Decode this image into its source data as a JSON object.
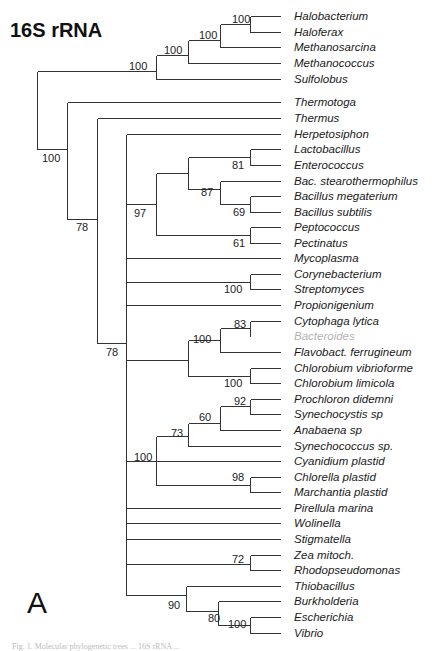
{
  "figure": {
    "title": "16S rRNA",
    "panel_label": "A",
    "caption_partial": "Fig. 1. Molecular phylogenetic trees ... 16S rRNA ..."
  },
  "tree": {
    "tip_line_end_x": 280,
    "tip_label_x": 294,
    "tips": [
      {
        "name": "Halobacterium",
        "y": 16
      },
      {
        "name": "Haloferax",
        "y": 32
      },
      {
        "name": "Methanosarcina",
        "y": 47
      },
      {
        "name": "Methanococcus",
        "y": 63
      },
      {
        "name": "Sulfolobus",
        "y": 79
      },
      {
        "name": "Thermotoga",
        "y": 102
      },
      {
        "name": "Thermus",
        "y": 118
      },
      {
        "name": "Herpetosiphon",
        "y": 134
      },
      {
        "name": "Lactobacillus",
        "y": 149
      },
      {
        "name": "Enterococcus",
        "y": 165
      },
      {
        "name": "Bac. stearothermophilus",
        "y": 181
      },
      {
        "name": "Bacillus megaterium",
        "y": 196
      },
      {
        "name": "Bacillus subtilis",
        "y": 212
      },
      {
        "name": "Peptococcus",
        "y": 227
      },
      {
        "name": "Pectinatus",
        "y": 243
      },
      {
        "name": "Mycoplasma",
        "y": 258
      },
      {
        "name": "Corynebacterium",
        "y": 274
      },
      {
        "name": "Streptomyces",
        "y": 289
      },
      {
        "name": "Propionigenium",
        "y": 305
      },
      {
        "name": "Cytophaga lytica",
        "y": 321
      },
      {
        "name": "Bacteroides",
        "y": 336,
        "faint": true
      },
      {
        "name": "Flavobact. ferrugineum",
        "y": 352
      },
      {
        "name": "Chlorobium vibrioforme",
        "y": 368
      },
      {
        "name": "Chlorobium limicola",
        "y": 383
      },
      {
        "name": "Prochloron didemni",
        "y": 399
      },
      {
        "name": "Synechocystis sp",
        "y": 414
      },
      {
        "name": "Anabaena sp",
        "y": 430
      },
      {
        "name": "Synechococcus sp.",
        "y": 446
      },
      {
        "name": "Cyanidium  plastid",
        "y": 461
      },
      {
        "name": "Chlorella plastid",
        "y": 477
      },
      {
        "name": "Marchantia plastid",
        "y": 492
      },
      {
        "name": "Pirellula marina",
        "y": 508
      },
      {
        "name": "Wolinella",
        "y": 523
      },
      {
        "name": "Stigmatella",
        "y": 539
      },
      {
        "name": "Zea mitoch.",
        "y": 555
      },
      {
        "name": "Rhodopseudomonas",
        "y": 570
      },
      {
        "name": "Thiobacillus",
        "y": 586
      },
      {
        "name": "Burkholderia",
        "y": 601
      },
      {
        "name": "Escherichia",
        "y": 617
      },
      {
        "name": "Vibrio",
        "y": 633
      }
    ],
    "branches": [
      {
        "x1": 250,
        "y1": 16,
        "x2": 280,
        "y2": 16
      },
      {
        "x1": 250,
        "y1": 32,
        "x2": 280,
        "y2": 32
      },
      {
        "x1": 250,
        "y1": 16,
        "x2": 250,
        "y2": 32
      },
      {
        "x1": 220,
        "y1": 24,
        "x2": 250,
        "y2": 24
      },
      {
        "x1": 220,
        "y1": 47,
        "x2": 280,
        "y2": 47
      },
      {
        "x1": 220,
        "y1": 24,
        "x2": 220,
        "y2": 47
      },
      {
        "x1": 188,
        "y1": 40,
        "x2": 220,
        "y2": 40
      },
      {
        "x1": 188,
        "y1": 63,
        "x2": 280,
        "y2": 63
      },
      {
        "x1": 188,
        "y1": 40,
        "x2": 188,
        "y2": 63
      },
      {
        "x1": 156,
        "y1": 55,
        "x2": 188,
        "y2": 55
      },
      {
        "x1": 156,
        "y1": 79,
        "x2": 280,
        "y2": 79
      },
      {
        "x1": 156,
        "y1": 55,
        "x2": 156,
        "y2": 79
      },
      {
        "x1": 37,
        "y1": 71,
        "x2": 156,
        "y2": 71
      },
      {
        "x1": 37,
        "y1": 71,
        "x2": 37,
        "y2": 149
      },
      {
        "x1": 37,
        "y1": 149,
        "x2": 67,
        "y2": 149
      },
      {
        "x1": 67,
        "y1": 102,
        "x2": 280,
        "y2": 102
      },
      {
        "x1": 67,
        "y1": 102,
        "x2": 67,
        "y2": 219
      },
      {
        "x1": 67,
        "y1": 219,
        "x2": 97,
        "y2": 219
      },
      {
        "x1": 97,
        "y1": 118,
        "x2": 280,
        "y2": 118
      },
      {
        "x1": 97,
        "y1": 118,
        "x2": 97,
        "y2": 343
      },
      {
        "x1": 97,
        "y1": 343,
        "x2": 126,
        "y2": 343
      },
      {
        "x1": 126,
        "y1": 134,
        "x2": 126,
        "y2": 595
      },
      {
        "x1": 126,
        "y1": 134,
        "x2": 280,
        "y2": 134
      },
      {
        "x1": 250,
        "y1": 149,
        "x2": 280,
        "y2": 149
      },
      {
        "x1": 250,
        "y1": 165,
        "x2": 280,
        "y2": 165
      },
      {
        "x1": 250,
        "y1": 149,
        "x2": 250,
        "y2": 165
      },
      {
        "x1": 188,
        "y1": 157,
        "x2": 250,
        "y2": 157
      },
      {
        "x1": 250,
        "y1": 196,
        "x2": 280,
        "y2": 196
      },
      {
        "x1": 250,
        "y1": 212,
        "x2": 280,
        "y2": 212
      },
      {
        "x1": 250,
        "y1": 196,
        "x2": 250,
        "y2": 212
      },
      {
        "x1": 220,
        "y1": 181,
        "x2": 280,
        "y2": 181
      },
      {
        "x1": 220,
        "y1": 204,
        "x2": 250,
        "y2": 204
      },
      {
        "x1": 220,
        "y1": 181,
        "x2": 220,
        "y2": 204
      },
      {
        "x1": 188,
        "y1": 189,
        "x2": 220,
        "y2": 189
      },
      {
        "x1": 188,
        "y1": 157,
        "x2": 188,
        "y2": 189
      },
      {
        "x1": 156,
        "y1": 173,
        "x2": 188,
        "y2": 173
      },
      {
        "x1": 250,
        "y1": 227,
        "x2": 280,
        "y2": 227
      },
      {
        "x1": 250,
        "y1": 243,
        "x2": 280,
        "y2": 243
      },
      {
        "x1": 250,
        "y1": 227,
        "x2": 250,
        "y2": 243
      },
      {
        "x1": 156,
        "y1": 235,
        "x2": 250,
        "y2": 235
      },
      {
        "x1": 156,
        "y1": 173,
        "x2": 156,
        "y2": 235
      },
      {
        "x1": 126,
        "y1": 204,
        "x2": 156,
        "y2": 204
      },
      {
        "x1": 126,
        "y1": 258,
        "x2": 280,
        "y2": 258
      },
      {
        "x1": 250,
        "y1": 274,
        "x2": 280,
        "y2": 274
      },
      {
        "x1": 250,
        "y1": 289,
        "x2": 280,
        "y2": 289
      },
      {
        "x1": 250,
        "y1": 274,
        "x2": 250,
        "y2": 289
      },
      {
        "x1": 126,
        "y1": 282,
        "x2": 250,
        "y2": 282
      },
      {
        "x1": 126,
        "y1": 305,
        "x2": 280,
        "y2": 305
      },
      {
        "x1": 250,
        "y1": 321,
        "x2": 280,
        "y2": 321
      },
      {
        "x1": 250,
        "y1": 321,
        "x2": 250,
        "y2": 336
      },
      {
        "x1": 220,
        "y1": 328,
        "x2": 250,
        "y2": 328
      },
      {
        "x1": 220,
        "y1": 352,
        "x2": 280,
        "y2": 352
      },
      {
        "x1": 220,
        "y1": 328,
        "x2": 220,
        "y2": 352
      },
      {
        "x1": 188,
        "y1": 340,
        "x2": 220,
        "y2": 340
      },
      {
        "x1": 250,
        "y1": 368,
        "x2": 280,
        "y2": 368
      },
      {
        "x1": 250,
        "y1": 383,
        "x2": 280,
        "y2": 383
      },
      {
        "x1": 250,
        "y1": 368,
        "x2": 250,
        "y2": 383
      },
      {
        "x1": 188,
        "y1": 376,
        "x2": 250,
        "y2": 376
      },
      {
        "x1": 188,
        "y1": 340,
        "x2": 188,
        "y2": 376
      },
      {
        "x1": 126,
        "y1": 360,
        "x2": 188,
        "y2": 360
      },
      {
        "x1": 250,
        "y1": 399,
        "x2": 280,
        "y2": 399
      },
      {
        "x1": 250,
        "y1": 414,
        "x2": 280,
        "y2": 414
      },
      {
        "x1": 250,
        "y1": 399,
        "x2": 250,
        "y2": 414
      },
      {
        "x1": 220,
        "y1": 406,
        "x2": 250,
        "y2": 406
      },
      {
        "x1": 220,
        "y1": 430,
        "x2": 280,
        "y2": 430
      },
      {
        "x1": 220,
        "y1": 406,
        "x2": 220,
        "y2": 430
      },
      {
        "x1": 188,
        "y1": 423,
        "x2": 220,
        "y2": 423
      },
      {
        "x1": 188,
        "y1": 446,
        "x2": 280,
        "y2": 446
      },
      {
        "x1": 188,
        "y1": 423,
        "x2": 188,
        "y2": 446
      },
      {
        "x1": 156,
        "y1": 436,
        "x2": 188,
        "y2": 436
      },
      {
        "x1": 250,
        "y1": 477,
        "x2": 280,
        "y2": 477
      },
      {
        "x1": 250,
        "y1": 492,
        "x2": 280,
        "y2": 492
      },
      {
        "x1": 250,
        "y1": 477,
        "x2": 250,
        "y2": 492
      },
      {
        "x1": 156,
        "y1": 485,
        "x2": 250,
        "y2": 485
      },
      {
        "x1": 156,
        "y1": 436,
        "x2": 156,
        "y2": 485
      },
      {
        "x1": 126,
        "y1": 461,
        "x2": 280,
        "y2": 461
      },
      {
        "x1": 126,
        "y1": 508,
        "x2": 280,
        "y2": 508
      },
      {
        "x1": 126,
        "y1": 523,
        "x2": 280,
        "y2": 523
      },
      {
        "x1": 126,
        "y1": 539,
        "x2": 280,
        "y2": 539
      },
      {
        "x1": 250,
        "y1": 555,
        "x2": 280,
        "y2": 555
      },
      {
        "x1": 250,
        "y1": 570,
        "x2": 280,
        "y2": 570
      },
      {
        "x1": 250,
        "y1": 555,
        "x2": 250,
        "y2": 570
      },
      {
        "x1": 126,
        "y1": 564,
        "x2": 250,
        "y2": 564
      },
      {
        "x1": 186,
        "y1": 586,
        "x2": 280,
        "y2": 586
      },
      {
        "x1": 186,
        "y1": 586,
        "x2": 186,
        "y2": 611
      },
      {
        "x1": 126,
        "y1": 595,
        "x2": 186,
        "y2": 595
      },
      {
        "x1": 218,
        "y1": 601,
        "x2": 280,
        "y2": 601
      },
      {
        "x1": 218,
        "y1": 601,
        "x2": 218,
        "y2": 625
      },
      {
        "x1": 186,
        "y1": 611,
        "x2": 218,
        "y2": 611
      },
      {
        "x1": 250,
        "y1": 617,
        "x2": 280,
        "y2": 617
      },
      {
        "x1": 250,
        "y1": 633,
        "x2": 280,
        "y2": 633
      },
      {
        "x1": 250,
        "y1": 617,
        "x2": 250,
        "y2": 633
      },
      {
        "x1": 218,
        "y1": 625,
        "x2": 250,
        "y2": 625
      }
    ],
    "support_values": [
      {
        "value": "100",
        "x": 232,
        "y": 23
      },
      {
        "value": "100",
        "x": 199,
        "y": 39
      },
      {
        "value": "100",
        "x": 164,
        "y": 54
      },
      {
        "value": "100",
        "x": 129,
        "y": 70
      },
      {
        "value": "100",
        "x": 42,
        "y": 162
      },
      {
        "value": "78",
        "x": 76,
        "y": 231
      },
      {
        "value": "81",
        "x": 232,
        "y": 169
      },
      {
        "value": "87",
        "x": 201,
        "y": 196
      },
      {
        "value": "69",
        "x": 233,
        "y": 216
      },
      {
        "value": "97",
        "x": 134,
        "y": 217
      },
      {
        "value": "61",
        "x": 233,
        "y": 247
      },
      {
        "value": "100",
        "x": 224,
        "y": 293
      },
      {
        "value": "78",
        "x": 106,
        "y": 356
      },
      {
        "value": "83",
        "x": 234,
        "y": 328
      },
      {
        "value": "100",
        "x": 193,
        "y": 343
      },
      {
        "value": "100",
        "x": 224,
        "y": 387
      },
      {
        "value": "92",
        "x": 234,
        "y": 405
      },
      {
        "value": "60",
        "x": 199,
        "y": 421
      },
      {
        "value": "73",
        "x": 171,
        "y": 437
      },
      {
        "value": "100",
        "x": 134,
        "y": 461
      },
      {
        "value": "98",
        "x": 232,
        "y": 481
      },
      {
        "value": "72",
        "x": 232,
        "y": 563
      },
      {
        "value": "90",
        "x": 168,
        "y": 609
      },
      {
        "value": "80",
        "x": 208,
        "y": 622
      },
      {
        "value": "100",
        "x": 228,
        "y": 628
      }
    ]
  },
  "chart_data": {
    "type": "tree",
    "title": "16S rRNA",
    "panel": "A",
    "newick": "(((((Halobacterium,Haloferax)100,Methanosarcina)100,Methanococcus)100,Sulfolobus)100,(Thermotoga,(Thermus,(Herpetosiphon,(((Lactobacillus,Enterococcus)81,(Bac. stearothermophilus,(Bacillus megaterium,Bacillus subtilis)69)87),(Peptococcus,Pectinatus)61)97,Mycoplasma,(Corynebacterium,Streptomyces)100,Propionigenium,(((Cytophaga lytica,Bacteroides)83,Flavobact. ferrugineum)100,(Chlorobium vibrioforme,Chlorobium limicola)100),((((Prochloron didemni,Synechocystis sp)92,Anabaena sp)60,Synechococcus sp.)73,(Chlorella plastid,Marchantia plastid)98)100,Cyanidium plastid,Pirellula marina,Wolinella,Stigmatella,(Zea mitoch.,Rhodopseudomonas)72,(Thiobacillus,(Burkholderia,(Escherichia,Vibrio)100)80)90))78)78)100);"
  }
}
